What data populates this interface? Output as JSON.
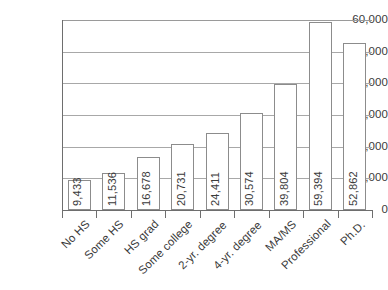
{
  "chart_data": {
    "type": "bar",
    "title": "",
    "subtitle": "",
    "xlabel": "",
    "ylabel": "",
    "ylim": [
      0,
      60000
    ],
    "y_ticks": [
      "0",
      "10,000",
      "20,000",
      "30,000",
      "40,000",
      "50,000",
      "60,000"
    ],
    "y_tick_values": [
      0,
      10000,
      20000,
      30000,
      40000,
      50000,
      60000
    ],
    "grid": true,
    "legend": "none",
    "orientation": "vertical",
    "categories": [
      "No HS",
      "Some HS",
      "HS grad",
      "Some college",
      "2-yr. degree",
      "4-yr. degree",
      "MA/MS",
      "Professional",
      "Ph.D."
    ],
    "values": [
      9433,
      11536,
      16678,
      20731,
      24411,
      30574,
      39804,
      59394,
      52862
    ],
    "data_labels": [
      "9,433",
      "11,536",
      "16,678",
      "20,731",
      "24,411",
      "30,574",
      "39,804",
      "59,394",
      "52,862"
    ],
    "colors": {
      "bar_fill": "#ffffff",
      "bar_border": "#8c8c8c",
      "gridline": "#a8a8a8",
      "axis": "#6e6e6e",
      "text": "#3a3a3a",
      "background": "#ffffff"
    }
  }
}
